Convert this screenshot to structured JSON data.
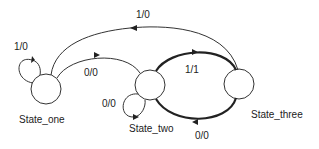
{
  "diagram": {
    "type": "state-machine",
    "states": [
      {
        "id": "s1",
        "label": "State_one"
      },
      {
        "id": "s2",
        "label": "State_two"
      },
      {
        "id": "s3",
        "label": "State_three"
      }
    ],
    "transitions": [
      {
        "from": "State_one",
        "to": "State_one",
        "label": "1/0"
      },
      {
        "from": "State_one",
        "to": "State_two",
        "label": "0/0"
      },
      {
        "from": "State_two",
        "to": "State_two",
        "label": "0/0"
      },
      {
        "from": "State_two",
        "to": "State_three",
        "label": "1/1"
      },
      {
        "from": "State_three",
        "to": "State_two",
        "label": "0/0"
      },
      {
        "from": "State_three",
        "to": "State_one",
        "label": "1/0"
      }
    ]
  }
}
